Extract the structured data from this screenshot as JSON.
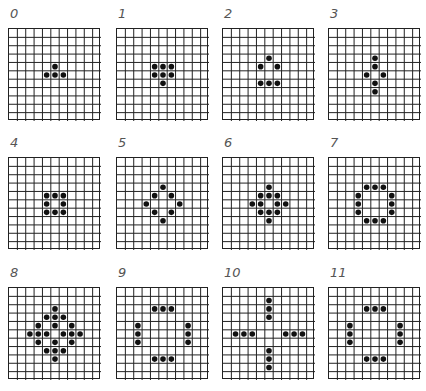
{
  "figure": {
    "grid_size": 11,
    "panels": [
      {
        "label": "0",
        "cells": [
          [
            4,
            5
          ],
          [
            5,
            4
          ],
          [
            5,
            5
          ],
          [
            5,
            6
          ]
        ]
      },
      {
        "label": "1",
        "cells": [
          [
            4,
            4
          ],
          [
            4,
            5
          ],
          [
            4,
            6
          ],
          [
            5,
            4
          ],
          [
            5,
            5
          ],
          [
            5,
            6
          ],
          [
            6,
            5
          ]
        ]
      },
      {
        "label": "2",
        "cells": [
          [
            3,
            5
          ],
          [
            4,
            4
          ],
          [
            4,
            6
          ],
          [
            6,
            4
          ],
          [
            6,
            5
          ],
          [
            6,
            6
          ]
        ]
      },
      {
        "label": "3",
        "cells": [
          [
            3,
            5
          ],
          [
            4,
            5
          ],
          [
            5,
            4
          ],
          [
            5,
            6
          ],
          [
            6,
            5
          ],
          [
            7,
            5
          ]
        ]
      },
      {
        "label": "4",
        "cells": [
          [
            4,
            4
          ],
          [
            4,
            5
          ],
          [
            4,
            6
          ],
          [
            5,
            4
          ],
          [
            5,
            6
          ],
          [
            6,
            4
          ],
          [
            6,
            5
          ],
          [
            6,
            6
          ]
        ]
      },
      {
        "label": "5",
        "cells": [
          [
            3,
            5
          ],
          [
            4,
            4
          ],
          [
            4,
            6
          ],
          [
            5,
            3
          ],
          [
            5,
            7
          ],
          [
            6,
            4
          ],
          [
            6,
            6
          ],
          [
            7,
            5
          ]
        ]
      },
      {
        "label": "6",
        "cells": [
          [
            3,
            5
          ],
          [
            4,
            4
          ],
          [
            4,
            5
          ],
          [
            4,
            6
          ],
          [
            5,
            3
          ],
          [
            5,
            4
          ],
          [
            5,
            6
          ],
          [
            5,
            7
          ],
          [
            6,
            4
          ],
          [
            6,
            5
          ],
          [
            6,
            6
          ],
          [
            7,
            5
          ]
        ]
      },
      {
        "label": "7",
        "cells": [
          [
            3,
            4
          ],
          [
            3,
            5
          ],
          [
            3,
            6
          ],
          [
            4,
            3
          ],
          [
            4,
            7
          ],
          [
            5,
            3
          ],
          [
            5,
            7
          ],
          [
            6,
            3
          ],
          [
            6,
            7
          ],
          [
            7,
            4
          ],
          [
            7,
            5
          ],
          [
            7,
            6
          ]
        ]
      },
      {
        "label": "8",
        "cells": [
          [
            2,
            5
          ],
          [
            3,
            4
          ],
          [
            3,
            5
          ],
          [
            3,
            6
          ],
          [
            4,
            3
          ],
          [
            4,
            5
          ],
          [
            4,
            7
          ],
          [
            5,
            2
          ],
          [
            5,
            3
          ],
          [
            5,
            4
          ],
          [
            5,
            6
          ],
          [
            5,
            7
          ],
          [
            5,
            8
          ],
          [
            6,
            3
          ],
          [
            6,
            5
          ],
          [
            6,
            7
          ],
          [
            7,
            4
          ],
          [
            7,
            5
          ],
          [
            7,
            6
          ],
          [
            8,
            5
          ]
        ]
      },
      {
        "label": "9",
        "cells": [
          [
            2,
            4
          ],
          [
            2,
            5
          ],
          [
            2,
            6
          ],
          [
            4,
            2
          ],
          [
            4,
            8
          ],
          [
            5,
            2
          ],
          [
            5,
            8
          ],
          [
            6,
            2
          ],
          [
            6,
            8
          ],
          [
            8,
            4
          ],
          [
            8,
            5
          ],
          [
            8,
            6
          ]
        ]
      },
      {
        "label": "10",
        "cells": [
          [
            1,
            5
          ],
          [
            2,
            5
          ],
          [
            3,
            5
          ],
          [
            5,
            1
          ],
          [
            5,
            2
          ],
          [
            5,
            3
          ],
          [
            5,
            7
          ],
          [
            5,
            8
          ],
          [
            5,
            9
          ],
          [
            7,
            5
          ],
          [
            8,
            5
          ],
          [
            9,
            5
          ]
        ]
      },
      {
        "label": "11",
        "cells": [
          [
            2,
            4
          ],
          [
            2,
            5
          ],
          [
            2,
            6
          ],
          [
            4,
            2
          ],
          [
            4,
            8
          ],
          [
            5,
            2
          ],
          [
            5,
            8
          ],
          [
            6,
            2
          ],
          [
            6,
            8
          ],
          [
            8,
            4
          ],
          [
            8,
            5
          ],
          [
            8,
            6
          ]
        ]
      }
    ],
    "colors": {
      "line": "#222222",
      "dot": "#111111",
      "label": "#555555"
    }
  }
}
